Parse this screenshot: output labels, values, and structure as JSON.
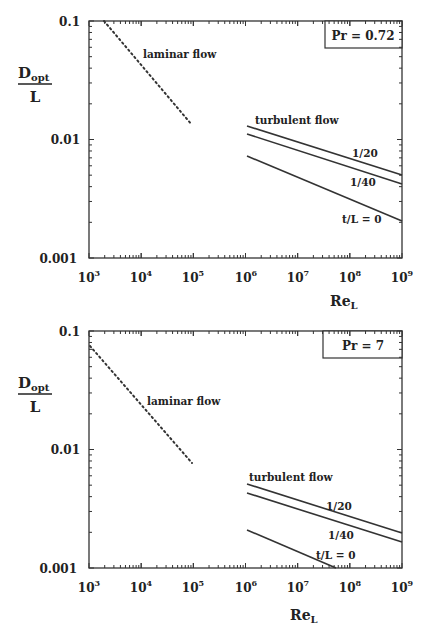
{
  "chart_data": [
    {
      "type": "line",
      "title": "Pr = 0.72",
      "xlabel": "Re_L",
      "ylabel": "D_opt / L",
      "xscale": "log",
      "yscale": "log",
      "xlim": [
        1000,
        1000000000
      ],
      "ylim": [
        0.001,
        0.1
      ],
      "x_ticks": [
        "10^3",
        "10^4",
        "10^5",
        "10^6",
        "10^7",
        "10^8",
        "10^9"
      ],
      "y_ticks": [
        "0.001",
        "0.01",
        "0.1"
      ],
      "grid": false,
      "legend": "inline annotations",
      "annotations": [
        "laminar flow",
        "turbulent flow",
        "1/20",
        "1/40",
        "t/L = 0"
      ],
      "series": [
        {
          "name": "laminar flow",
          "style": "dotted",
          "x": [
            1900,
            95000
          ],
          "y": [
            0.1,
            0.0132
          ]
        },
        {
          "name": "t/L = 1/20",
          "style": "solid",
          "x": [
            1000000,
            1000000000
          ],
          "y": [
            0.013,
            0.005
          ]
        },
        {
          "name": "t/L = 1/40",
          "style": "solid",
          "x": [
            1000000,
            1000000000
          ],
          "y": [
            0.0111,
            0.0042
          ]
        },
        {
          "name": "t/L = 0",
          "style": "solid",
          "x": [
            1000000,
            1000000000
          ],
          "y": [
            0.0073,
            0.002
          ]
        }
      ]
    },
    {
      "type": "line",
      "title": "Pr = 7",
      "xlabel": "Re_L",
      "ylabel": "D_opt / L",
      "xscale": "log",
      "yscale": "log",
      "xlim": [
        1000,
        1000000000
      ],
      "ylim": [
        0.001,
        0.1
      ],
      "x_ticks": [
        "10^3",
        "10^4",
        "10^5",
        "10^6",
        "10^7",
        "10^8",
        "10^9"
      ],
      "y_ticks": [
        "0.001",
        "0.01",
        "0.1"
      ],
      "grid": false,
      "legend": "inline annotations",
      "annotations": [
        "laminar flow",
        "turbulent flow",
        "1/20",
        "1/40",
        "t/L = 0"
      ],
      "series": [
        {
          "name": "laminar flow",
          "style": "dotted",
          "x": [
            1000,
            95000
          ],
          "y": [
            0.075,
            0.0077
          ]
        },
        {
          "name": "t/L = 1/20",
          "style": "solid",
          "x": [
            1000000,
            1000000000
          ],
          "y": [
            0.005,
            0.0021
          ]
        },
        {
          "name": "t/L = 1/40",
          "style": "solid",
          "x": [
            1000000,
            1000000000
          ],
          "y": [
            0.0043,
            0.0018
          ]
        },
        {
          "name": "t/L = 0",
          "style": "solid",
          "x": [
            1000000,
            50000000
          ],
          "y": [
            0.0021,
            0.001
          ]
        }
      ]
    }
  ],
  "charts": [
    {
      "pr_label": "Pr = 0.72",
      "y_num": "D",
      "y_sub": "opt",
      "y_den": "L",
      "y_ticks": [
        "0.1",
        "0.01",
        "0.001"
      ],
      "x_ticks": [
        "3",
        "4",
        "5",
        "6",
        "7",
        "8",
        "9"
      ],
      "x_base": "10",
      "x_label_main": "Re",
      "x_label_sub": "L",
      "laminar_label": "laminar flow",
      "turbulent_label": "turbulent flow",
      "l20": "1/20",
      "l40": "1/40",
      "l0": "t/L = 0"
    },
    {
      "pr_label": "Pr = 7",
      "y_num": "D",
      "y_sub": "opt",
      "y_den": "L",
      "y_ticks": [
        "0.1",
        "0.01",
        "0.001"
      ],
      "x_ticks": [
        "3",
        "4",
        "5",
        "6",
        "7",
        "8",
        "9"
      ],
      "x_base": "10",
      "x_label_main": "Re",
      "x_label_sub": "L",
      "laminar_label": "laminar flow",
      "turbulent_label": "turbulent flow",
      "l20": "1/20",
      "l40": "1/40",
      "l0": "t/L = 0"
    }
  ]
}
